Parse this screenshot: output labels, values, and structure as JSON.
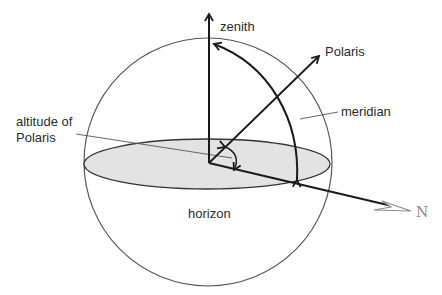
{
  "diagram": {
    "type": "celestial-sphere",
    "labels": {
      "zenith": "zenith",
      "polaris": "Polaris",
      "meridian": "meridian",
      "altitude_line1": "altitude of",
      "altitude_line2": "Polaris",
      "horizon": "horizon",
      "north": "N"
    },
    "colors": {
      "sphere_outline": "#555555",
      "horizon_fill": "#e3e3e3",
      "horizon_outline": "#333333",
      "arrows": "#1a1a1a",
      "north_arrow": "#8a8a8a",
      "leader_lines": "#555555"
    }
  }
}
